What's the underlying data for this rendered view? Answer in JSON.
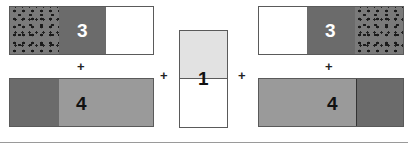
{
  "diagram": {
    "left_group": {
      "top_bar": {
        "label": "3",
        "segments": [
          "dotted",
          "dark",
          "white"
        ]
      },
      "operator": "+",
      "bottom_bar": {
        "label": "4",
        "segments": [
          "dark",
          "light",
          "light"
        ]
      }
    },
    "operator_left": "+",
    "middle_group": {
      "label": "1",
      "segments": [
        "pale",
        "white"
      ]
    },
    "operator_right": "+",
    "right_group": {
      "top_bar": {
        "label": "3",
        "segments": [
          "white",
          "dark",
          "dotted"
        ]
      },
      "operator": "+",
      "bottom_bar": {
        "label": "4",
        "segments": [
          "light",
          "light",
          "dark"
        ]
      }
    },
    "colors": {
      "dark": "#6b6b6b",
      "light": "#9a9a9a",
      "pale": "#e2e2e2",
      "white": "#ffffff",
      "dots": "#1a1a1a"
    }
  }
}
